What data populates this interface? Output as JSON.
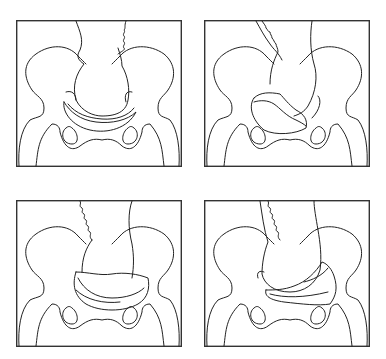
{
  "figure": {
    "layout": "2x2 grid",
    "panels": [
      {
        "id": "top-left",
        "hatched_region": "crescent, centered, symmetric"
      },
      {
        "id": "top-right",
        "hatched_region": "kidney-shaped, shifted left"
      },
      {
        "id": "bottom-left",
        "hatched_region": "broad crescent, centered-wide"
      },
      {
        "id": "bottom-right",
        "hatched_region": "wedge, tilted toward right"
      }
    ],
    "colors": {
      "line": "#222222",
      "background": "#ffffff"
    }
  }
}
